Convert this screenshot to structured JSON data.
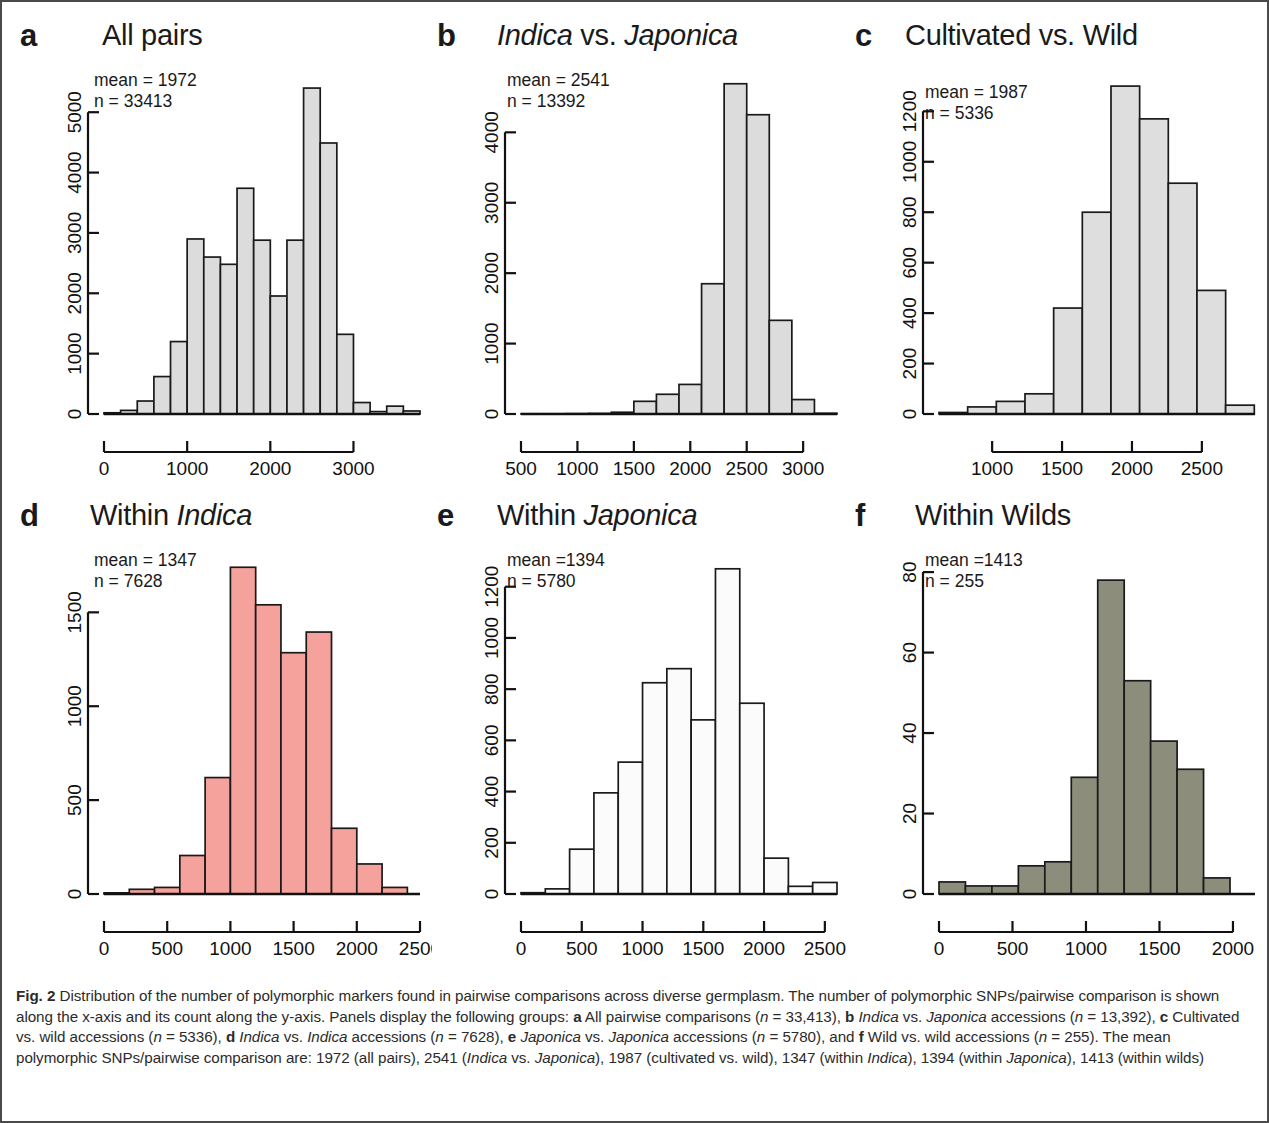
{
  "figure": {
    "label": "Fig. 2",
    "caption_parts": {
      "s1": "Distribution of the number of polymorphic markers found in pairwise comparisons across diverse germplasm. The number of polymorphic SNPs/pairwise comparison is shown along the x-axis and its count along the y-axis. Panels display the following groups: ",
      "a_label": "a",
      "s2": " All pairwise comparisons (",
      "n_a_i": "n",
      "s3": " = 33,413), ",
      "b_label": "b",
      "s4": " ",
      "b_it1": "Indica",
      "s5": " vs. ",
      "b_it2": "Japonica",
      "s6": " accessions (",
      "n_b_i": "n",
      "s7": " = 13,392), ",
      "c_label": "c",
      "s8": " Cultivated vs. wild accessions (",
      "n_c_i": "n",
      "s9": " = 5336), ",
      "d_label": "d",
      "s10": " ",
      "d_it1": "Indica",
      "s11": " vs. ",
      "d_it2": "Indica",
      "s12": " accessions (",
      "n_d_i": "n",
      "s13": " = 7628), ",
      "e_label": "e",
      "s14": " ",
      "e_it1": "Japonica",
      "s15": " vs. ",
      "e_it2": "Japonica",
      "s16": " accessions (",
      "n_e_i": "n",
      "s17": " = 5780), and ",
      "f_label": "f",
      "s18": " Wild vs. wild accessions (",
      "n_f_i": "n",
      "s19": " = 255). The mean polymorphic SNPs/pairwise comparison are: 1972 (all pairs), 2541 (",
      "f_it1": "Indica",
      "s20": " vs. ",
      "f_it2": "Japonica",
      "s21": "), 1987 (cultivated vs. wild), 1347 (within ",
      "f_it3": "Indica",
      "s22": "), 1394 (within ",
      "f_it4": "Japonica",
      "s23": "), 1413 (within wilds)"
    }
  },
  "panels": {
    "a": {
      "letter": "a",
      "title_plain": "All pairs",
      "title_italic": "",
      "mean_text": "mean = 1972",
      "n_text": "n = 33413",
      "fill": "#dcdcdc"
    },
    "b": {
      "letter": "b",
      "title_plain": "",
      "title_italic_1": "Indica",
      "title_mid": " vs. ",
      "title_italic_2": "Japonica",
      "mean_text": "mean = 2541",
      "n_text": "n = 13392",
      "fill": "#dcdcdc"
    },
    "c": {
      "letter": "c",
      "title_plain": "Cultivated vs. Wild",
      "mean_text": "mean = 1987",
      "n_text": "n = 5336",
      "fill": "#dedede"
    },
    "d": {
      "letter": "d",
      "title_pre": "Within ",
      "title_italic": "Indica",
      "mean_text": "mean = 1347",
      "n_text": "n = 7628",
      "fill": "#f5a29c"
    },
    "e": {
      "letter": "e",
      "title_pre": "Within ",
      "title_italic": "Japonica",
      "mean_text": "mean =1394",
      "n_text": "n = 5780",
      "fill": "#fbfbfb"
    },
    "f": {
      "letter": "f",
      "title_plain": "Within Wilds",
      "mean_text": "mean =1413",
      "n_text": "n = 255",
      "fill": "#8d8d7b"
    }
  },
  "chart_data": [
    {
      "panel": "a",
      "type": "bar",
      "title": "All pairs",
      "xlabel": "",
      "ylabel": "",
      "xlim": [
        0,
        3800
      ],
      "ylim": [
        0,
        5600
      ],
      "xticks": [
        0,
        1000,
        2000,
        3000
      ],
      "yticks": [
        0,
        1000,
        2000,
        3000,
        4000,
        5000
      ],
      "grid": false,
      "bin_width": 200,
      "bin_starts": [
        0,
        200,
        400,
        600,
        800,
        1000,
        1200,
        1400,
        1600,
        1800,
        2000,
        2200,
        2400,
        2600,
        2800,
        3000,
        3200,
        3400,
        3600
      ],
      "values": [
        20,
        60,
        215,
        620,
        1200,
        2900,
        2600,
        2480,
        3740,
        2880,
        1955,
        2880,
        5400,
        4490,
        1320,
        190,
        40,
        130,
        50
      ],
      "mean": 1972,
      "n": 33413
    },
    {
      "panel": "b",
      "type": "bar",
      "title": "Indica vs. Japonica",
      "xlabel": "",
      "ylabel": "",
      "xlim": [
        500,
        3300
      ],
      "ylim": [
        0,
        4800
      ],
      "xticks": [
        500,
        1000,
        1500,
        2000,
        2500,
        3000
      ],
      "yticks": [
        0,
        1000,
        2000,
        3000,
        4000
      ],
      "grid": false,
      "bin_width": 200,
      "bin_starts": [
        500,
        700,
        900,
        1100,
        1300,
        1500,
        1700,
        1900,
        2100,
        2300,
        2500,
        2700,
        2900,
        3100
      ],
      "values": [
        3,
        3,
        5,
        8,
        25,
        180,
        280,
        420,
        1850,
        4690,
        4250,
        1330,
        205,
        10
      ],
      "mean": 2541,
      "n": 13392
    },
    {
      "panel": "c",
      "type": "bar",
      "title": "Cultivated vs. Wild",
      "xlabel": "",
      "ylabel": "",
      "xlim": [
        620,
        2880
      ],
      "ylim": [
        0,
        1340
      ],
      "xticks": [
        1000,
        1500,
        2000,
        2500
      ],
      "yticks": [
        0,
        200,
        400,
        600,
        800,
        1000,
        1200
      ],
      "grid": false,
      "bin_width": 205,
      "bin_starts": [
        620,
        825,
        1030,
        1235,
        1440,
        1645,
        1850,
        2055,
        2260,
        2465,
        2670
      ],
      "values": [
        6,
        28,
        50,
        80,
        420,
        800,
        1300,
        1170,
        915,
        490,
        35
      ],
      "mean": 1987,
      "n": 5336
    },
    {
      "panel": "d",
      "type": "bar",
      "title": "Within Indica",
      "xlabel": "",
      "ylabel": "",
      "xlim": [
        0,
        2500
      ],
      "ylim": [
        0,
        1800
      ],
      "xticks": [
        0,
        500,
        1000,
        1500,
        2000,
        2500
      ],
      "yticks": [
        0,
        500,
        1000,
        1500
      ],
      "grid": false,
      "bin_width": 200,
      "bin_starts": [
        0,
        200,
        400,
        600,
        800,
        1000,
        1200,
        1400,
        1600,
        1800,
        2000,
        2200
      ],
      "values": [
        6,
        25,
        35,
        205,
        620,
        1740,
        1540,
        1285,
        1395,
        350,
        160,
        35
      ],
      "mean": 1347,
      "n": 7628
    },
    {
      "panel": "e",
      "type": "bar",
      "title": "Within Japonica",
      "xlabel": "",
      "ylabel": "",
      "xlim": [
        0,
        2600
      ],
      "ylim": [
        0,
        1320
      ],
      "xticks": [
        0,
        500,
        1000,
        1500,
        2000,
        2500
      ],
      "yticks": [
        0,
        200,
        400,
        600,
        800,
        1000,
        1200
      ],
      "grid": false,
      "bin_width": 200,
      "bin_starts": [
        0,
        200,
        400,
        600,
        800,
        1000,
        1200,
        1400,
        1600,
        1800,
        2000,
        2200,
        2400
      ],
      "values": [
        5,
        20,
        175,
        395,
        515,
        825,
        880,
        680,
        1270,
        745,
        140,
        30,
        45
      ],
      "mean": 1394,
      "n": 5780
    },
    {
      "panel": "f",
      "type": "bar",
      "title": "Within Wilds",
      "xlabel": "",
      "ylabel": "",
      "xlim": [
        0,
        2150
      ],
      "ylim": [
        0,
        84
      ],
      "xticks": [
        0,
        500,
        1000,
        1500,
        2000
      ],
      "yticks": [
        0,
        20,
        40,
        60,
        80
      ],
      "grid": false,
      "bin_width": 180,
      "bin_starts": [
        0,
        180,
        360,
        540,
        720,
        900,
        1080,
        1260,
        1440,
        1620,
        1800,
        1980
      ],
      "values": [
        3,
        2,
        2,
        7,
        8,
        29,
        78,
        53,
        38,
        31,
        4,
        0
      ],
      "mean": 1413,
      "n": 255
    }
  ]
}
